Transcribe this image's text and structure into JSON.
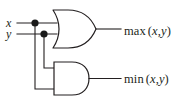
{
  "figure": {
    "background_color": "#ffffff",
    "stroke_color": "#231f20",
    "junction_color": "#1a1a1a"
  },
  "inputs": [
    {
      "id": "x",
      "label": "x",
      "wire_y": 23
    },
    {
      "id": "y",
      "label": "y",
      "wire_y": 34
    }
  ],
  "gates": [
    {
      "id": "or-gate",
      "type": "OR",
      "icon": "or-gate-icon",
      "inputs": [
        "x",
        "y"
      ],
      "output": "max"
    },
    {
      "id": "and-gate",
      "type": "AND",
      "icon": "and-gate-icon",
      "inputs": [
        "x",
        "y"
      ],
      "output": "min"
    }
  ],
  "outputs": [
    {
      "id": "max",
      "fn": "max",
      "open_paren": "(",
      "arg1": "x",
      "comma": ",",
      "arg2": "y",
      "close_paren": ")"
    },
    {
      "id": "min",
      "fn": "min",
      "open_paren": "(",
      "arg1": "x",
      "comma": ",",
      "arg2": "y",
      "close_paren": ")"
    }
  ],
  "junctions": [
    {
      "id": "x-junction",
      "x": 35,
      "y": 23
    },
    {
      "id": "y-junction",
      "x": 44,
      "y": 34
    }
  ]
}
